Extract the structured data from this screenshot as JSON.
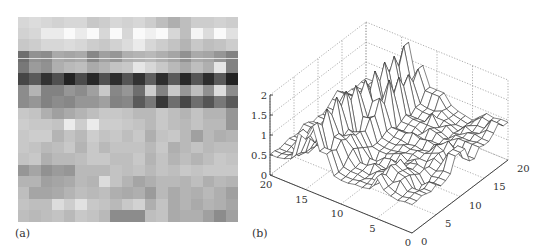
{
  "figure": {
    "panels": [
      {
        "id": "a",
        "label": "(a)",
        "description": "grayscale image matrix"
      },
      {
        "id": "b",
        "label": "(b)",
        "description": "3D mesh surface plot"
      }
    ]
  },
  "chart_data": [
    {
      "type": "heatmap",
      "title": "",
      "label": "(a)",
      "colormap": "gray",
      "rows": 18,
      "cols": 19,
      "note": "values are grayscale intensities 0 (black) to 255 (white), approximated",
      "values": [
        [
          215,
          220,
          215,
          210,
          215,
          215,
          200,
          205,
          215,
          210,
          215,
          205,
          190,
          175,
          190,
          205,
          205,
          210,
          205
        ],
        [
          210,
          215,
          235,
          235,
          250,
          235,
          250,
          215,
          250,
          215,
          250,
          240,
          250,
          215,
          190,
          245,
          220,
          250,
          225
        ],
        [
          200,
          205,
          215,
          215,
          220,
          215,
          205,
          200,
          210,
          220,
          235,
          215,
          205,
          195,
          180,
          200,
          190,
          195,
          205
        ],
        [
          110,
          145,
          140,
          170,
          165,
          170,
          135,
          160,
          150,
          175,
          180,
          185,
          175,
          165,
          145,
          170,
          165,
          150,
          130
        ],
        [
          120,
          155,
          145,
          175,
          185,
          190,
          170,
          180,
          195,
          200,
          230,
          215,
          200,
          185,
          170,
          190,
          175,
          230,
          130
        ],
        [
          70,
          90,
          50,
          80,
          35,
          75,
          40,
          80,
          45,
          85,
          50,
          95,
          45,
          90,
          40,
          85,
          45,
          90,
          35
        ],
        [
          140,
          180,
          130,
          130,
          150,
          140,
          160,
          200,
          135,
          150,
          110,
          205,
          130,
          200,
          150,
          190,
          145,
          220,
          140
        ],
        [
          140,
          150,
          130,
          140,
          135,
          150,
          150,
          160,
          130,
          135,
          90,
          120,
          55,
          110,
          70,
          110,
          85,
          120,
          90
        ],
        [
          200,
          195,
          175,
          160,
          170,
          180,
          190,
          200,
          200,
          195,
          185,
          185,
          200,
          190,
          180,
          195,
          180,
          180,
          150
        ],
        [
          205,
          200,
          200,
          195,
          235,
          205,
          235,
          205,
          205,
          200,
          195,
          185,
          200,
          190,
          185,
          195,
          185,
          185,
          150
        ],
        [
          200,
          205,
          205,
          180,
          195,
          185,
          205,
          195,
          200,
          190,
          200,
          175,
          195,
          200,
          185,
          160,
          185,
          175,
          180
        ],
        [
          200,
          195,
          185,
          190,
          200,
          180,
          200,
          185,
          195,
          195,
          195,
          185,
          200,
          175,
          185,
          195,
          185,
          190,
          190
        ],
        [
          195,
          200,
          175,
          185,
          185,
          190,
          200,
          200,
          190,
          190,
          200,
          180,
          195,
          180,
          190,
          180,
          190,
          200,
          195
        ],
        [
          150,
          165,
          145,
          155,
          150,
          185,
          185,
          185,
          195,
          190,
          195,
          185,
          195,
          190,
          200,
          195,
          200,
          200,
          200
        ],
        [
          180,
          180,
          160,
          165,
          170,
          185,
          180,
          220,
          195,
          180,
          165,
          175,
          185,
          185,
          180,
          190,
          175,
          185,
          180
        ],
        [
          190,
          165,
          165,
          170,
          180,
          190,
          185,
          190,
          175,
          170,
          175,
          155,
          185,
          170,
          180,
          175,
          185,
          175,
          160
        ],
        [
          195,
          190,
          190,
          220,
          205,
          225,
          200,
          195,
          185,
          200,
          210,
          175,
          195,
          170,
          180,
          170,
          180,
          175,
          165
        ],
        [
          190,
          185,
          190,
          195,
          185,
          200,
          195,
          185,
          140,
          140,
          140,
          190,
          195,
          170,
          175,
          175,
          160,
          140,
          160
        ]
      ]
    },
    {
      "type": "surface",
      "title": "",
      "label": "(b)",
      "style": "wireframe mesh",
      "x_axis": {
        "label": "",
        "range": [
          0,
          20
        ],
        "ticks": [
          0,
          5,
          10,
          15,
          20
        ]
      },
      "y_axis": {
        "label": "",
        "range": [
          0,
          20
        ],
        "ticks": [
          0,
          5,
          10,
          15,
          20
        ]
      },
      "z_axis": {
        "label": "",
        "range": [
          0,
          2
        ],
        "ticks": [
          0,
          0.5,
          1,
          1.5,
          2
        ],
        "tick_labels": [
          "0",
          "0.5",
          "1",
          "1.5",
          "2"
        ]
      },
      "grid": "dotted",
      "note": "surface is the 3D rendering of panel (a); a row of sharp spikes (height ~1.2-1.9) runs along one edge, a broad ridge ~1.7 peaks near x~12,y~12"
    }
  ],
  "axis_labels": {
    "z_ticks": [
      "2",
      "1.5",
      "1",
      "0.5",
      "0"
    ],
    "left_ticks": [
      "20",
      "15",
      "10",
      "5",
      "0"
    ],
    "right_ticks": [
      "0",
      "5",
      "10",
      "15",
      "20"
    ]
  }
}
